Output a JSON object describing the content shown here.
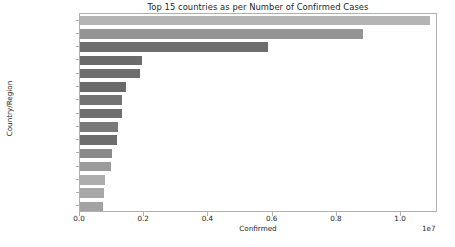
{
  "chart_data": {
    "type": "bar",
    "orientation": "horizontal",
    "title": "Top 15 countries as per Number of Confirmed Cases",
    "xlabel": "Confirmed",
    "ylabel": "Country/Region",
    "x_offset_text": "1e7",
    "x_tick_labels": [
      "0.0",
      "0.2",
      "0.4",
      "0.6",
      "0.8",
      "1.0"
    ],
    "x_tick_values": [
      0,
      2000000,
      4000000,
      6000000,
      8000000,
      10000000
    ],
    "xlim": [
      0,
      11150000
    ],
    "grid": false,
    "legend": null,
    "categories": [
      "US",
      "India",
      "Brazil",
      "France",
      "Russia",
      "Spain",
      "United Kingdom",
      "Argentina",
      "Colombia",
      "Italy",
      "Mexico",
      "Peru",
      "Germany",
      "Iran",
      "South Africa"
    ],
    "values": [
      10890000,
      8815000,
      5850000,
      1920000,
      1880000,
      1420000,
      1320000,
      1310000,
      1180000,
      1140000,
      1000000,
      950000,
      790000,
      740000,
      730000
    ],
    "bar_colors": [
      "#b4b4b4",
      "#949494",
      "#6e6e6e",
      "#6b6b6b",
      "#6e6e6e",
      "#6a6a6a",
      "#737373",
      "#6f6f6f",
      "#797979",
      "#6d6d6d",
      "#8a8a8a",
      "#9b9b9b",
      "#adadad",
      "#a8a8a8",
      "#a3a3a3"
    ]
  }
}
